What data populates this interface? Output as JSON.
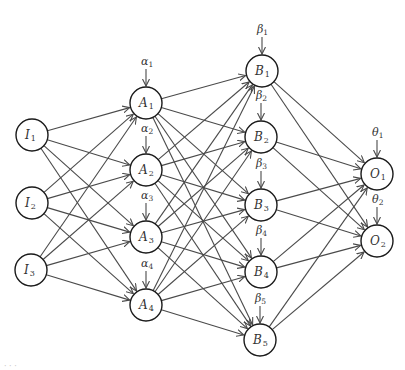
{
  "diagram": {
    "type": "feedforward-neural-network",
    "colors": {
      "edge": "#4a4a4a",
      "node_stroke": "#1a1a1a",
      "node_fill": "#ffffff",
      "text": "#333333"
    },
    "node_radius": 16,
    "layers": [
      {
        "name": "input",
        "nodes": [
          {
            "id": "I1",
            "base": "I",
            "sub": "1",
            "x": 32,
            "y": 135
          },
          {
            "id": "I2",
            "base": "I",
            "sub": "2",
            "x": 32,
            "y": 203
          },
          {
            "id": "I3",
            "base": "I",
            "sub": "3",
            "x": 31,
            "y": 270
          }
        ]
      },
      {
        "name": "hidden-A",
        "nodes": [
          {
            "id": "A1",
            "base": "A",
            "sub": "1",
            "x": 146,
            "y": 103,
            "bias": {
              "base": "α",
              "sub": "1"
            }
          },
          {
            "id": "A2",
            "base": "A",
            "sub": "2",
            "x": 146,
            "y": 170,
            "bias": {
              "base": "α",
              "sub": "2"
            }
          },
          {
            "id": "A3",
            "base": "A",
            "sub": "3",
            "x": 146,
            "y": 237,
            "bias": {
              "base": "α",
              "sub": "3"
            }
          },
          {
            "id": "A4",
            "base": "A",
            "sub": "4",
            "x": 146,
            "y": 305,
            "bias": {
              "base": "α",
              "sub": "4"
            }
          }
        ]
      },
      {
        "name": "hidden-B",
        "nodes": [
          {
            "id": "B1",
            "base": "B",
            "sub": "1",
            "x": 262,
            "y": 71,
            "bias": {
              "base": "β",
              "sub": "1"
            }
          },
          {
            "id": "B2",
            "base": "B",
            "sub": "2",
            "x": 261,
            "y": 137,
            "bias": {
              "base": "β",
              "sub": "2"
            }
          },
          {
            "id": "B3",
            "base": "B",
            "sub": "3",
            "x": 261,
            "y": 205,
            "bias": {
              "base": "β",
              "sub": "3"
            }
          },
          {
            "id": "B4",
            "base": "B",
            "sub": "4",
            "x": 261,
            "y": 272,
            "bias": {
              "base": "β",
              "sub": "4"
            }
          },
          {
            "id": "B5",
            "base": "B",
            "sub": "5",
            "x": 260,
            "y": 340,
            "bias": {
              "base": "β",
              "sub": "5"
            }
          }
        ]
      },
      {
        "name": "output",
        "nodes": [
          {
            "id": "O1",
            "base": "O",
            "sub": "1",
            "x": 377,
            "y": 174,
            "bias": {
              "base": "θ",
              "sub": "1"
            }
          },
          {
            "id": "O2",
            "base": "O",
            "sub": "2",
            "x": 377,
            "y": 241,
            "bias": {
              "base": "θ",
              "sub": "2"
            }
          }
        ]
      }
    ],
    "connectivity": "fully-connected between consecutive layers",
    "caption": "· · ·"
  }
}
